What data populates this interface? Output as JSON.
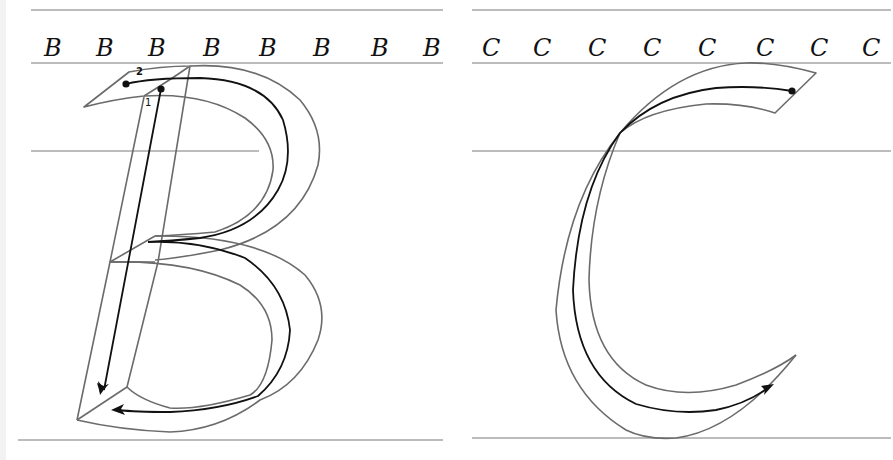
{
  "worksheet": {
    "panels": [
      {
        "letter": "B",
        "samples": [
          "B",
          "B",
          "B",
          "B",
          "B",
          "B",
          "B",
          "B"
        ],
        "stroke_numbers": [
          "1",
          "2"
        ],
        "strokes": [
          {
            "order": "1",
            "direction": "downward stem"
          },
          {
            "order": "2",
            "direction": "top bowl then lower bowl ending with leftward arrow"
          }
        ]
      },
      {
        "letter": "C",
        "samples": [
          "C",
          "C",
          "C",
          "C",
          "C",
          "C",
          "C",
          "C"
        ],
        "stroke_numbers": [],
        "strokes": [
          {
            "order": "1",
            "direction": "from top-right dot, sweeps left and down, ends with upward arrow at right"
          }
        ]
      }
    ],
    "colors": {
      "guide_line": "#7a7a7a",
      "outline": "#6b6b6b",
      "path": "#111111",
      "background": "#ffffff"
    }
  }
}
